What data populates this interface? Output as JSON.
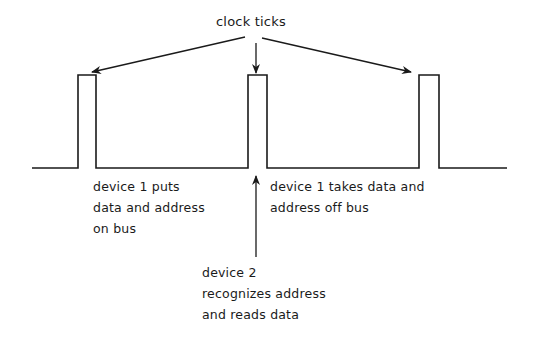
{
  "diagram": {
    "type": "timing-diagram",
    "title_label": "clock ticks",
    "signal": {
      "name": "clock",
      "baseline_y": 168,
      "high_y": 75,
      "x_start": 32,
      "x_end": 507,
      "pulses": [
        {
          "id": "tick-1",
          "x_rise": 78,
          "x_fall": 96
        },
        {
          "id": "tick-2",
          "x_rise": 248,
          "x_fall": 267
        },
        {
          "id": "tick-3",
          "x_rise": 419,
          "x_fall": 439
        }
      ]
    },
    "annotations": [
      {
        "id": "device1-puts",
        "lines": [
          "device 1 puts",
          "data and address",
          "on bus"
        ]
      },
      {
        "id": "device1-takes-off",
        "lines": [
          "device 1 takes data and",
          "address off bus"
        ]
      },
      {
        "id": "device2-reads",
        "lines": [
          "device 2",
          "recognizes address",
          "and reads data"
        ]
      }
    ],
    "arrows": [
      {
        "id": "arrow-to-tick-1",
        "from": [
          245,
          37
        ],
        "to": [
          92,
          72
        ]
      },
      {
        "id": "arrow-to-tick-2",
        "from": [
          256,
          43
        ],
        "to": [
          256,
          73
        ]
      },
      {
        "id": "arrow-to-tick-3",
        "from": [
          262,
          38
        ],
        "to": [
          411,
          72
        ]
      },
      {
        "id": "arrow-device2-to-tick-2",
        "from": [
          256,
          257
        ],
        "to": [
          256,
          176
        ]
      }
    ],
    "colors": {
      "ink": "#1a1a1a",
      "background": "#ffffff"
    }
  }
}
